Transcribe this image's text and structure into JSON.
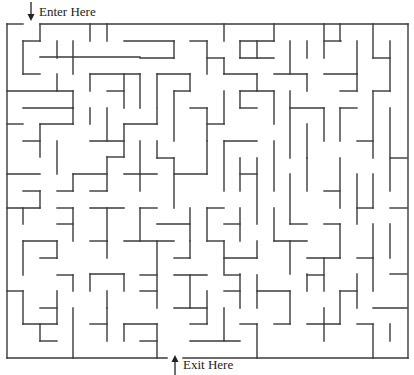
{
  "labels": {
    "enter": "Enter Here",
    "exit": "Exit Here"
  },
  "icons": {
    "enter_arrow": "arrow-down-icon",
    "exit_arrow": "arrow-up-icon"
  },
  "colors": {
    "wall": "#3a3a3a",
    "background": "#ffffff",
    "text": "#222222"
  },
  "maze": {
    "bounds": {
      "left": 7,
      "top": 24,
      "right": 408,
      "bottom": 358
    },
    "cell_size": 16.7,
    "columns": 24,
    "rows": 20,
    "entrance": {
      "x1": 23,
      "x2": 40,
      "y": 24
    },
    "exit": {
      "x1": 167,
      "x2": 183,
      "y": 358
    },
    "walls": [
      [
        7,
        24,
        23,
        24
      ],
      [
        40,
        24,
        408,
        24
      ],
      [
        7,
        24,
        7,
        358
      ],
      [
        408,
        24,
        408,
        358
      ],
      [
        7,
        358,
        167,
        358
      ],
      [
        183,
        358,
        408,
        358
      ],
      [
        40,
        24,
        40,
        41
      ],
      [
        23,
        41,
        40,
        41
      ],
      [
        23,
        41,
        23,
        74
      ],
      [
        23,
        74,
        40,
        74
      ],
      [
        90,
        24,
        90,
        41
      ],
      [
        107,
        24,
        107,
        41
      ],
      [
        124,
        41,
        174,
        41
      ],
      [
        174,
        41,
        174,
        58
      ],
      [
        140,
        58,
        174,
        58
      ],
      [
        57,
        41,
        57,
        58
      ],
      [
        73,
        41,
        73,
        74
      ],
      [
        40,
        57,
        140,
        57
      ],
      [
        57,
        74,
        57,
        91
      ],
      [
        7,
        91,
        73,
        91
      ],
      [
        73,
        91,
        73,
        108
      ],
      [
        90,
        74,
        140,
        74
      ],
      [
        140,
        74,
        140,
        108
      ],
      [
        90,
        74,
        90,
        91
      ],
      [
        107,
        91,
        124,
        91
      ],
      [
        124,
        74,
        124,
        108
      ],
      [
        157,
        74,
        157,
        107
      ],
      [
        157,
        74,
        190,
        74
      ],
      [
        190,
        74,
        190,
        91
      ],
      [
        174,
        91,
        190,
        91
      ],
      [
        190,
        41,
        207,
        41
      ],
      [
        207,
        41,
        207,
        74
      ],
      [
        207,
        58,
        224,
        58
      ],
      [
        224,
        58,
        224,
        74
      ],
      [
        224,
        24,
        224,
        41
      ],
      [
        240,
        41,
        274,
        41
      ],
      [
        240,
        41,
        240,
        58
      ],
      [
        257,
        41,
        257,
        58
      ],
      [
        240,
        58,
        274,
        58
      ],
      [
        274,
        24,
        274,
        41
      ],
      [
        290,
        41,
        290,
        74
      ],
      [
        307,
        41,
        307,
        58
      ],
      [
        324,
        24,
        324,
        58
      ],
      [
        324,
        41,
        341,
        41
      ],
      [
        357,
        41,
        357,
        74
      ],
      [
        340,
        24,
        340,
        41
      ],
      [
        373,
        24,
        373,
        58
      ],
      [
        373,
        58,
        390,
        58
      ],
      [
        390,
        41,
        390,
        91
      ],
      [
        224,
        74,
        257,
        74
      ],
      [
        257,
        74,
        257,
        91
      ],
      [
        274,
        74,
        307,
        74
      ],
      [
        307,
        74,
        307,
        91
      ],
      [
        324,
        74,
        357,
        74
      ],
      [
        340,
        91,
        357,
        91
      ],
      [
        357,
        74,
        357,
        91
      ],
      [
        7,
        124,
        23,
        124
      ],
      [
        23,
        108,
        73,
        108
      ],
      [
        40,
        124,
        73,
        124
      ],
      [
        40,
        124,
        40,
        157
      ],
      [
        23,
        141,
        40,
        141
      ],
      [
        57,
        141,
        57,
        174
      ],
      [
        73,
        108,
        73,
        124
      ],
      [
        90,
        108,
        90,
        124
      ],
      [
        107,
        108,
        107,
        141
      ],
      [
        90,
        141,
        124,
        141
      ],
      [
        124,
        124,
        157,
        124
      ],
      [
        124,
        124,
        124,
        157
      ],
      [
        157,
        108,
        157,
        124
      ],
      [
        174,
        91,
        174,
        141
      ],
      [
        190,
        108,
        207,
        108
      ],
      [
        207,
        108,
        207,
        141
      ],
      [
        207,
        124,
        224,
        124
      ],
      [
        224,
        91,
        224,
        124
      ],
      [
        240,
        91,
        274,
        91
      ],
      [
        240,
        91,
        240,
        108
      ],
      [
        240,
        108,
        257,
        108
      ],
      [
        274,
        91,
        274,
        124
      ],
      [
        290,
        91,
        290,
        158
      ],
      [
        290,
        108,
        324,
        108
      ],
      [
        307,
        124,
        307,
        158
      ],
      [
        324,
        108,
        324,
        141
      ],
      [
        340,
        108,
        357,
        108
      ],
      [
        340,
        108,
        340,
        141
      ],
      [
        373,
        91,
        390,
        91
      ],
      [
        373,
        91,
        373,
        158
      ],
      [
        357,
        141,
        373,
        141
      ],
      [
        390,
        108,
        390,
        191
      ],
      [
        390,
        158,
        407,
        158
      ],
      [
        7,
        174,
        40,
        174
      ],
      [
        23,
        191,
        40,
        191
      ],
      [
        40,
        191,
        40,
        208
      ],
      [
        57,
        191,
        73,
        191
      ],
      [
        73,
        174,
        107,
        174
      ],
      [
        73,
        174,
        73,
        191
      ],
      [
        107,
        157,
        124,
        157
      ],
      [
        107,
        157,
        107,
        191
      ],
      [
        90,
        191,
        107,
        191
      ],
      [
        140,
        141,
        140,
        191
      ],
      [
        124,
        174,
        157,
        174
      ],
      [
        157,
        158,
        174,
        158
      ],
      [
        157,
        141,
        157,
        158
      ],
      [
        174,
        174,
        207,
        174
      ],
      [
        174,
        158,
        174,
        208
      ],
      [
        207,
        141,
        207,
        174
      ],
      [
        224,
        141,
        257,
        141
      ],
      [
        224,
        141,
        224,
        191
      ],
      [
        240,
        158,
        240,
        191
      ],
      [
        240,
        174,
        257,
        174
      ],
      [
        257,
        158,
        257,
        224
      ],
      [
        274,
        141,
        274,
        191
      ],
      [
        290,
        174,
        290,
        224
      ],
      [
        307,
        158,
        307,
        191
      ],
      [
        324,
        191,
        340,
        191
      ],
      [
        340,
        158,
        340,
        208
      ],
      [
        357,
        174,
        357,
        224
      ],
      [
        357,
        208,
        373,
        208
      ],
      [
        373,
        174,
        373,
        208
      ],
      [
        390,
        208,
        407,
        208
      ],
      [
        7,
        208,
        40,
        208
      ],
      [
        23,
        208,
        23,
        224
      ],
      [
        57,
        208,
        73,
        208
      ],
      [
        57,
        224,
        73,
        224
      ],
      [
        73,
        208,
        73,
        241
      ],
      [
        90,
        208,
        124,
        208
      ],
      [
        107,
        208,
        107,
        241
      ],
      [
        140,
        208,
        157,
        208
      ],
      [
        140,
        208,
        140,
        241
      ],
      [
        157,
        224,
        190,
        224
      ],
      [
        190,
        208,
        190,
        241
      ],
      [
        207,
        208,
        224,
        208
      ],
      [
        207,
        208,
        207,
        241
      ],
      [
        224,
        224,
        240,
        224
      ],
      [
        240,
        208,
        240,
        241
      ],
      [
        274,
        208,
        274,
        241
      ],
      [
        290,
        224,
        307,
        224
      ],
      [
        324,
        224,
        340,
        224
      ],
      [
        340,
        224,
        340,
        258
      ],
      [
        373,
        224,
        373,
        258
      ],
      [
        390,
        224,
        390,
        258
      ],
      [
        23,
        241,
        57,
        241
      ],
      [
        23,
        241,
        23,
        275
      ],
      [
        40,
        258,
        57,
        258
      ],
      [
        57,
        241,
        57,
        258
      ],
      [
        90,
        241,
        107,
        241
      ],
      [
        107,
        241,
        107,
        258
      ],
      [
        124,
        241,
        174,
        241
      ],
      [
        157,
        241,
        157,
        274
      ],
      [
        174,
        258,
        190,
        258
      ],
      [
        190,
        241,
        190,
        258
      ],
      [
        207,
        241,
        224,
        241
      ],
      [
        224,
        258,
        257,
        258
      ],
      [
        224,
        241,
        224,
        274
      ],
      [
        257,
        241,
        257,
        258
      ],
      [
        274,
        241,
        307,
        241
      ],
      [
        290,
        241,
        290,
        274
      ],
      [
        307,
        258,
        340,
        258
      ],
      [
        324,
        258,
        324,
        291
      ],
      [
        357,
        258,
        373,
        258
      ],
      [
        373,
        258,
        373,
        291
      ],
      [
        390,
        274,
        407,
        274
      ],
      [
        7,
        291,
        23,
        291
      ],
      [
        23,
        291,
        23,
        324
      ],
      [
        23,
        324,
        57,
        324
      ],
      [
        40,
        308,
        57,
        308
      ],
      [
        57,
        291,
        57,
        324
      ],
      [
        40,
        324,
        40,
        341
      ],
      [
        57,
        275,
        73,
        275
      ],
      [
        73,
        275,
        73,
        291
      ],
      [
        90,
        274,
        124,
        274
      ],
      [
        90,
        274,
        90,
        291
      ],
      [
        107,
        291,
        107,
        308
      ],
      [
        124,
        274,
        124,
        291
      ],
      [
        140,
        275,
        157,
        275
      ],
      [
        157,
        275,
        157,
        308
      ],
      [
        140,
        291,
        157,
        291
      ],
      [
        174,
        275,
        207,
        275
      ],
      [
        190,
        275,
        190,
        308
      ],
      [
        207,
        291,
        207,
        324
      ],
      [
        174,
        308,
        207,
        308
      ],
      [
        224,
        275,
        240,
        275
      ],
      [
        224,
        291,
        240,
        291
      ],
      [
        240,
        274,
        240,
        308
      ],
      [
        257,
        275,
        257,
        308
      ],
      [
        257,
        291,
        290,
        291
      ],
      [
        290,
        291,
        290,
        324
      ],
      [
        307,
        275,
        324,
        275
      ],
      [
        307,
        274,
        307,
        291
      ],
      [
        340,
        291,
        357,
        291
      ],
      [
        340,
        291,
        340,
        324
      ],
      [
        373,
        308,
        407,
        308
      ],
      [
        357,
        274,
        357,
        308
      ],
      [
        40,
        341,
        57,
        341
      ],
      [
        73,
        308,
        73,
        358
      ],
      [
        90,
        324,
        107,
        324
      ],
      [
        107,
        308,
        107,
        341
      ],
      [
        124,
        324,
        157,
        324
      ],
      [
        124,
        324,
        124,
        341
      ],
      [
        140,
        341,
        157,
        341
      ],
      [
        157,
        324,
        157,
        358
      ],
      [
        190,
        324,
        207,
        324
      ],
      [
        190,
        341,
        240,
        341
      ],
      [
        224,
        308,
        224,
        341
      ],
      [
        240,
        324,
        257,
        324
      ],
      [
        257,
        324,
        257,
        358
      ],
      [
        274,
        324,
        290,
        324
      ],
      [
        307,
        324,
        340,
        324
      ],
      [
        324,
        308,
        324,
        341
      ],
      [
        357,
        324,
        373,
        324
      ],
      [
        373,
        324,
        373,
        358
      ],
      [
        390,
        324,
        390,
        341
      ]
    ]
  }
}
